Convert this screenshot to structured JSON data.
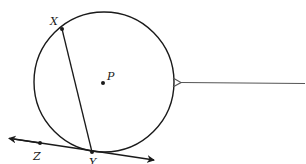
{
  "diagram": {
    "type": "geometry",
    "colors": {
      "stroke": "#1a1a1a",
      "arrow": "#555555",
      "background": "#ffffff"
    },
    "circle": {
      "cx": 104,
      "cy": 82,
      "r": 70,
      "center_label": "P"
    },
    "points": [
      {
        "id": "X",
        "label": "X",
        "x": 62,
        "y": 29
      },
      {
        "id": "Y",
        "label": "Y",
        "x": 92,
        "y": 152
      },
      {
        "id": "Z",
        "label": "Z",
        "x": 40,
        "y": 144
      },
      {
        "id": "P",
        "label": "P",
        "x": 103,
        "y": 82
      }
    ],
    "segments": [
      {
        "name": "chord-XY",
        "from": "X",
        "to": "Y"
      }
    ],
    "lines": [
      {
        "name": "tangent-line-ZY",
        "through": [
          "Z",
          "Y"
        ],
        "arrows": "both"
      }
    ],
    "arrow": {
      "from": [
        305,
        83
      ],
      "to": [
        181,
        83
      ]
    },
    "labels": {
      "X": "X",
      "Y": "Y",
      "Z": "Z",
      "P": "P"
    }
  }
}
